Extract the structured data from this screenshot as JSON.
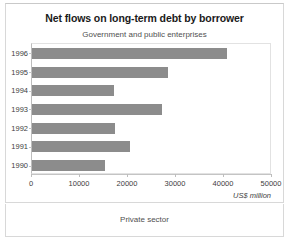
{
  "panel_top": {
    "title": "Net flows on long-term debt by borrower",
    "subtitle": "Government and public enterprises"
  },
  "panel_bottom": {
    "subtitle": "Private sector"
  },
  "axis": {
    "unit_label": "US$ million",
    "x_ticks": [
      "0",
      "10000",
      "20000",
      "30000",
      "40000",
      "50000"
    ],
    "y_ticks": [
      "1996",
      "1995",
      "1994",
      "1993",
      "1992",
      "1991",
      "1990"
    ]
  },
  "style": {
    "bar_color": "#8c8c8c",
    "frame_color": "#e2e2e2",
    "text_color": "#3d3d3d"
  },
  "chart_data": {
    "type": "bar",
    "orientation": "horizontal",
    "title": "Net flows on long-term debt by borrower",
    "subtitle": "Government and public enterprises",
    "xlabel": "US$ million",
    "ylabel": "",
    "xlim": [
      0,
      50000
    ],
    "xticks": [
      0,
      10000,
      20000,
      30000,
      40000,
      50000
    ],
    "grid": false,
    "legend": "none",
    "categories": [
      "1996",
      "1995",
      "1994",
      "1993",
      "1992",
      "1991",
      "1990"
    ],
    "values": [
      40600,
      28300,
      17100,
      27100,
      17300,
      20400,
      15200
    ],
    "bar_color": "#8c8c8c"
  }
}
